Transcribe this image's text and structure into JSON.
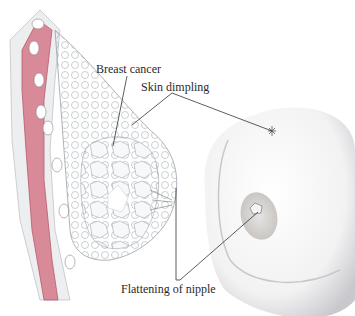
{
  "figure": {
    "labels": {
      "breast_cancer": "Breast cancer",
      "skin_dimpling": "Skin dimpling",
      "flattening_of_nipple": "Flattening of nipple"
    },
    "colors": {
      "muscle": "#d88a98",
      "muscle_dark": "#b85a6c",
      "tissue": "#e6e8ec",
      "tissue_line": "#9aa0a8",
      "leader_line": "#333333",
      "skin_shade": "#c8c8cc"
    }
  }
}
